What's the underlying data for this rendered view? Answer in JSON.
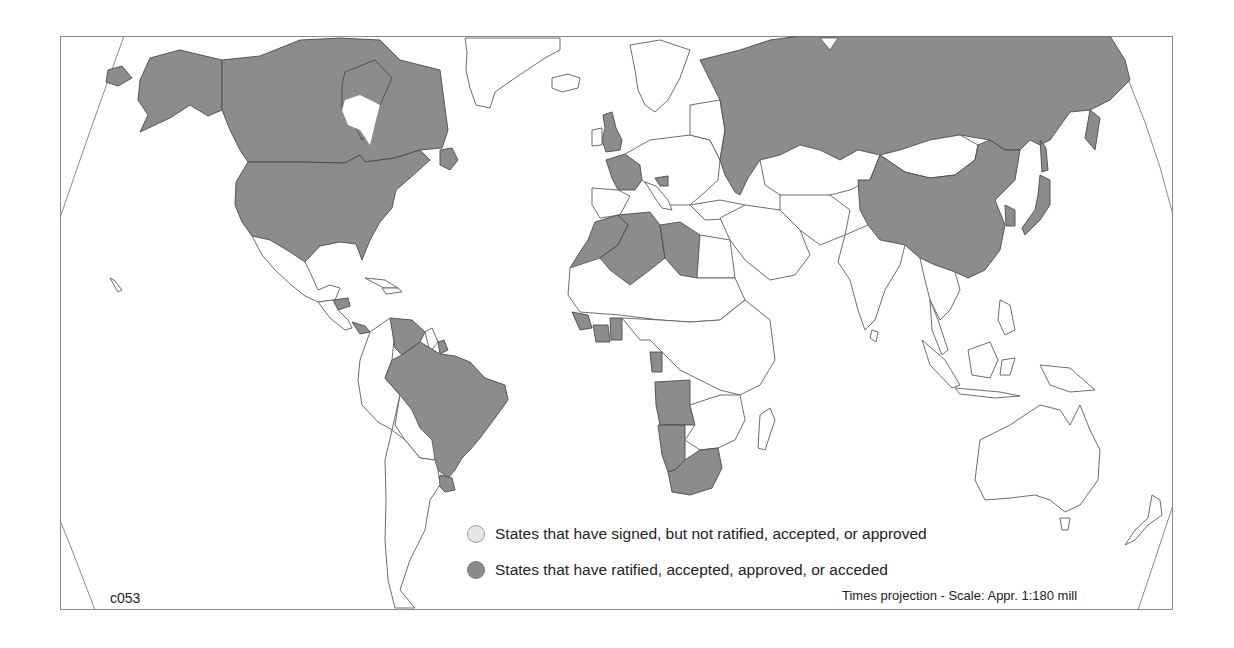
{
  "map": {
    "code": "c053",
    "projection_note": "Times projection - Scale: Appr. 1:180 mill",
    "colors": {
      "signed_not_ratified": "#e6e6e6",
      "ratified": "#8c8c8c",
      "non_party": "#ffffff",
      "border": "#5e5e5e"
    }
  },
  "legend": {
    "items": [
      {
        "id": "signed",
        "label": "States that have signed, but not ratified, accepted, or approved",
        "color": "#e6e6e6"
      },
      {
        "id": "ratified",
        "label": "States that have ratified, accepted, approved, or acceded",
        "color": "#8a8a8a"
      }
    ]
  },
  "shaded_regions": {
    "ratified": [
      "Canada",
      "United States",
      "Honduras",
      "Panama",
      "Venezuela",
      "Suriname",
      "Brazil",
      "Uruguay",
      "United Kingdom",
      "France",
      "Croatia",
      "Russia",
      "Morocco",
      "Western Sahara",
      "Algeria",
      "Libya",
      "Guinea",
      "Côte d'Ivoire",
      "Ghana",
      "Gabon",
      "Angola",
      "Namibia",
      "South Africa",
      "China",
      "South Korea",
      "Japan"
    ]
  }
}
